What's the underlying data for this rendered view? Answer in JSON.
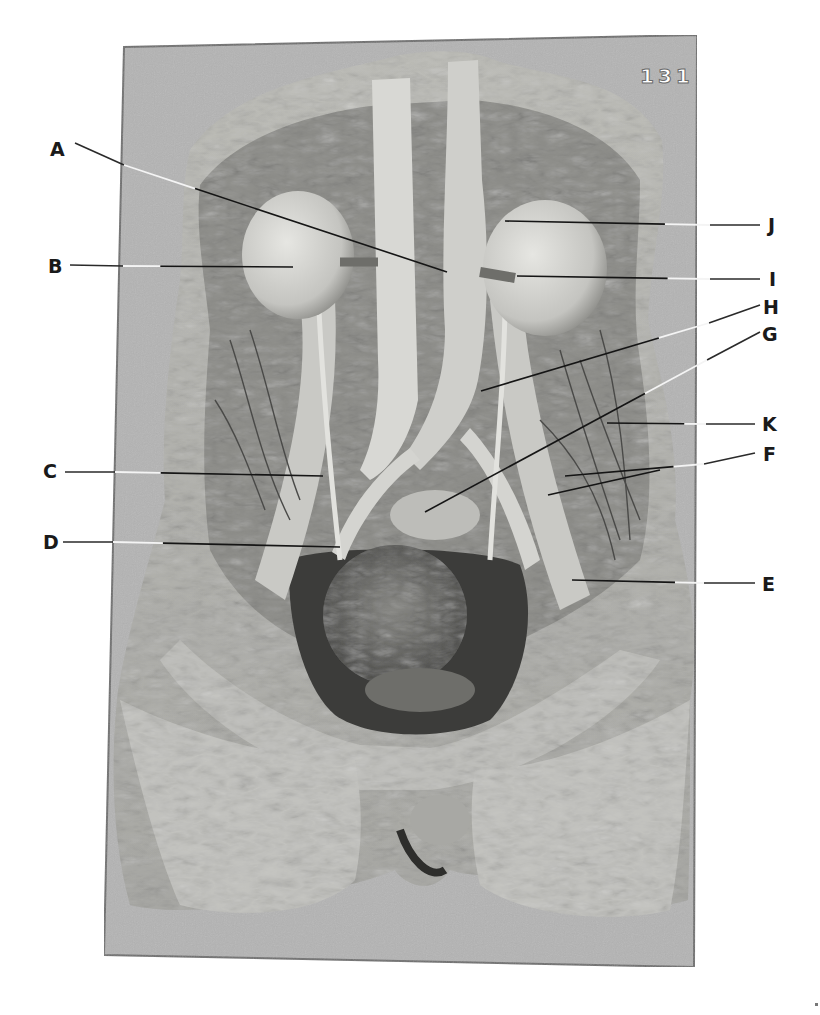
{
  "page": {
    "page_number": "131",
    "figure_type": "anatomical dissection photograph",
    "background_color": "#ffffff",
    "photo_background_color": "#b4b4b4",
    "frame_border_color": "#6e6e6e"
  },
  "photo_frame": {
    "corners": {
      "top_left": [
        124,
        47
      ],
      "top_right": [
        697,
        35
      ],
      "bottom_right": [
        694,
        967
      ],
      "bottom_left": [
        104,
        955
      ]
    }
  },
  "labels": [
    {
      "id": "A",
      "text": "A",
      "side": "left",
      "text_pos": [
        50,
        140
      ],
      "line": [
        [
          75,
          143
        ],
        [
          124,
          165
        ],
        [
          447,
          272
        ]
      ]
    },
    {
      "id": "B",
      "text": "B",
      "side": "left",
      "text_pos": [
        48,
        257
      ],
      "line": [
        [
          70,
          265
        ],
        [
          123,
          266
        ],
        [
          293,
          267
        ]
      ]
    },
    {
      "id": "C",
      "text": "C",
      "side": "left",
      "text_pos": [
        43,
        462
      ],
      "line": [
        [
          65,
          472
        ],
        [
          115,
          472
        ],
        [
          323,
          476
        ]
      ]
    },
    {
      "id": "D",
      "text": "D",
      "side": "left",
      "text_pos": [
        43,
        533
      ],
      "line": [
        [
          63,
          542
        ],
        [
          113,
          542
        ],
        [
          340,
          547
        ]
      ]
    },
    {
      "id": "E",
      "text": "E",
      "side": "right",
      "text_pos": [
        762,
        575
      ],
      "line": [
        [
          755,
          583
        ],
        [
          704,
          583
        ],
        [
          572,
          580
        ]
      ]
    },
    {
      "id": "F",
      "text": "F",
      "side": "right",
      "text_pos": [
        763,
        445
      ],
      "line": [
        [
          755,
          453
        ],
        [
          704,
          464
        ],
        [
          565,
          476
        ]
      ],
      "branches": [
        [
          [
            660,
            470
          ],
          [
            548,
            495
          ]
        ]
      ]
    },
    {
      "id": "G",
      "text": "G",
      "side": "right",
      "text_pos": [
        762,
        325
      ],
      "line": [
        [
          760,
          332
        ],
        [
          707,
          360
        ],
        [
          425,
          512
        ]
      ]
    },
    {
      "id": "H",
      "text": "H",
      "side": "right",
      "text_pos": [
        763,
        298
      ],
      "line": [
        [
          760,
          305
        ],
        [
          709,
          323
        ],
        [
          481,
          391
        ]
      ]
    },
    {
      "id": "I",
      "text": "I",
      "side": "right",
      "text_pos": [
        769,
        270
      ],
      "line": [
        [
          760,
          279
        ],
        [
          710,
          279
        ],
        [
          517,
          276
        ]
      ]
    },
    {
      "id": "J",
      "text": "J",
      "side": "right",
      "text_pos": [
        768,
        216
      ],
      "line": [
        [
          760,
          225
        ],
        [
          710,
          225
        ],
        [
          505,
          221
        ]
      ]
    },
    {
      "id": "K",
      "text": "K",
      "side": "right",
      "text_pos": [
        762,
        415
      ],
      "line": [
        [
          755,
          424
        ],
        [
          706,
          424
        ],
        [
          607,
          423
        ]
      ]
    }
  ],
  "specimen_regions": [
    {
      "name": "left-kidney",
      "center": [
        298,
        255
      ],
      "rx": 56,
      "ry": 64
    },
    {
      "name": "right-kidney",
      "center": [
        545,
        268
      ],
      "rx": 62,
      "ry": 68
    },
    {
      "name": "bladder-uterus",
      "center": [
        395,
        620
      ],
      "rx": 75,
      "ry": 75
    }
  ]
}
